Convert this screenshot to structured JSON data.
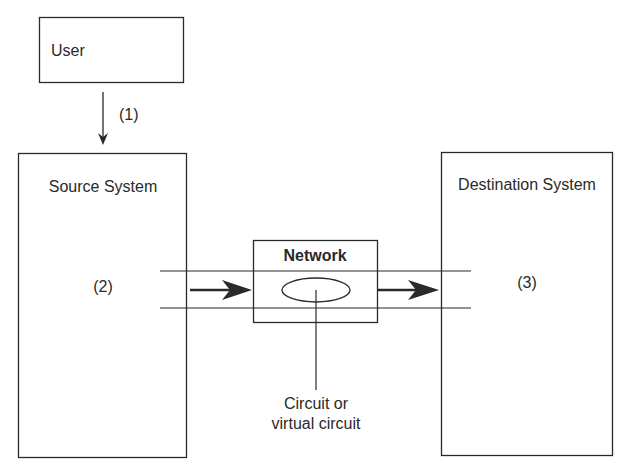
{
  "diagram": {
    "nodes": {
      "user": {
        "label": "User"
      },
      "source": {
        "label": "Source System",
        "step": "(2)"
      },
      "network": {
        "label": "Network"
      },
      "destination": {
        "label": "Destination System",
        "step": "(3)"
      }
    },
    "edges": {
      "user_to_source": {
        "step": "(1)"
      }
    },
    "annotations": {
      "circuit_line1": "Circuit or",
      "circuit_line2": "virtual circuit"
    },
    "colors": {
      "stroke": "#2a2a2a",
      "background": "#ffffff"
    }
  }
}
